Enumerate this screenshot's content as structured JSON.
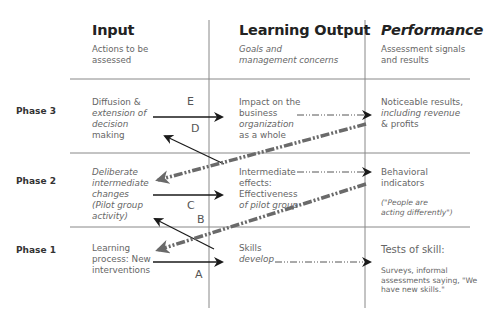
{
  "columns": [
    {
      "title": "Input",
      "subtitle_l1": "Actions to be",
      "subtitle_l2": "assessed"
    },
    {
      "title": "Learning Output",
      "subtitle_l1": "Goals and",
      "subtitle_l2": "management concerns"
    },
    {
      "title": "Performance",
      "subtitle_l1": "Assessment signals",
      "subtitle_l2": "and results"
    }
  ],
  "phases": [
    {
      "label": "Phase 3",
      "input": [
        "Diffusion &",
        "extension of",
        "decision",
        "making"
      ],
      "output": [
        "Impact on the",
        "business",
        "organization",
        "as a whole"
      ],
      "performance": [
        "Noticeable results,",
        "including revenue",
        "& profits"
      ]
    },
    {
      "label": "Phase 2",
      "input": [
        "Deliberate",
        "intermediate",
        "changes",
        "(Pilot group",
        "activity)"
      ],
      "output": [
        "Intermediate",
        "effects:",
        "Effectiveness",
        "of pilot group"
      ],
      "performance": [
        "Behavioral",
        "indicators"
      ],
      "performance_note": [
        "(\"People are",
        "acting differently\")"
      ]
    },
    {
      "label": "Phase 1",
      "input": [
        "Learning",
        "process: New",
        "interventions"
      ],
      "output": [
        "Skills",
        "develop"
      ],
      "performance": [
        "Tests of skill:"
      ],
      "performance_note": [
        "Surveys, informal",
        "assessments saying, \"We",
        "have new skills.\""
      ]
    }
  ],
  "arrow_labels": {
    "a": "A",
    "b": "B",
    "c": "C",
    "d": "D",
    "e": "E"
  },
  "colors": {
    "grid": "#888888",
    "arrow": "#1a1a1a",
    "feedback": "#6a6a6a"
  }
}
